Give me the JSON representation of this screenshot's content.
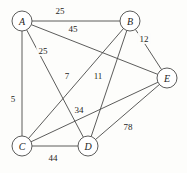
{
  "figure": {
    "kind": "weighted-undirected-graph",
    "width": 187,
    "height": 173,
    "background_color": "#fdfdfb",
    "stroke_color": "#4a4a48",
    "text_color": "#1d1d1b"
  },
  "chart_data": {
    "type": "diagram",
    "title": "",
    "xlabel": "",
    "ylabel": "",
    "nodes": [
      {
        "id": "A",
        "label": "A",
        "x": 22,
        "y": 21,
        "r": 10
      },
      {
        "id": "B",
        "label": "B",
        "x": 130,
        "y": 21,
        "r": 10
      },
      {
        "id": "E",
        "label": "E",
        "x": 167,
        "y": 78,
        "r": 10
      },
      {
        "id": "C",
        "label": "C",
        "x": 22,
        "y": 146,
        "r": 10
      },
      {
        "id": "D",
        "label": "D",
        "x": 88,
        "y": 146,
        "r": 10
      }
    ],
    "edges": [
      {
        "from": "A",
        "to": "B",
        "weight": "25",
        "lx": 60,
        "ly": 11
      },
      {
        "from": "A",
        "to": "E",
        "weight": "45",
        "lx": 73,
        "ly": 29
      },
      {
        "from": "A",
        "to": "D",
        "weight": "25",
        "lx": 43,
        "ly": 51
      },
      {
        "from": "A",
        "to": "C",
        "weight": "5",
        "lx": 13,
        "ly": 99
      },
      {
        "from": "B",
        "to": "E",
        "weight": "12",
        "lx": 144,
        "ly": 39
      },
      {
        "from": "B",
        "to": "C",
        "weight": "7",
        "lx": 67,
        "ly": 76
      },
      {
        "from": "B",
        "to": "D",
        "weight": "11",
        "lx": 98,
        "ly": 76
      },
      {
        "from": "C",
        "to": "E",
        "weight": "34",
        "lx": 79,
        "ly": 110
      },
      {
        "from": "C",
        "to": "D",
        "weight": "44",
        "lx": 53,
        "ly": 158
      },
      {
        "from": "D",
        "to": "E",
        "weight": "78",
        "lx": 128,
        "ly": 127
      }
    ]
  }
}
